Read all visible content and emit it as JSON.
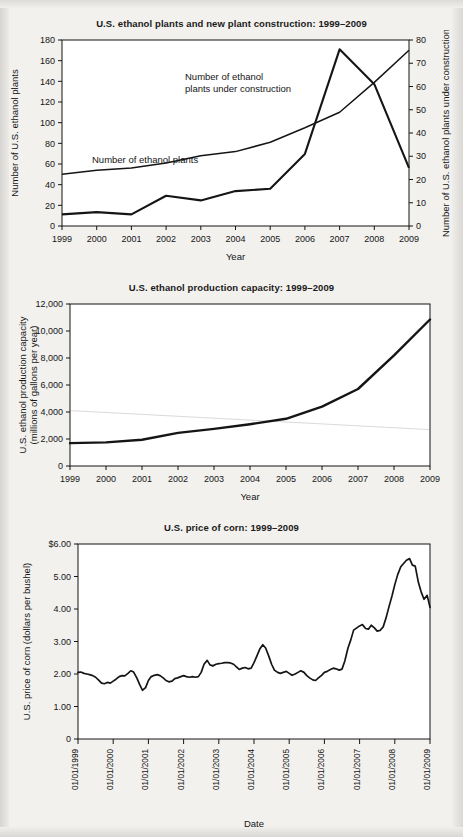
{
  "page": {
    "background_color": "#f2f1ee",
    "ink_color": "#151515"
  },
  "figures": [
    {
      "id": "ethanol-plants",
      "title": "U.S. ethanol plants and new plant construction: 1999–2009",
      "xlabel": "Year",
      "ylabel_left": "Number of U.S. ethanol plants",
      "ylabel_right": "Number of U.S. ethanol plants under construction",
      "annotations": [
        {
          "text_line_1": "Number of ethanol",
          "text_line_2": "plants under construction"
        },
        {
          "text_line_1": "Number of ethanol plants",
          "text_line_2": ""
        }
      ]
    },
    {
      "id": "ethanol-capacity",
      "title": "U.S. ethanol production capacity: 1999–2009",
      "xlabel": "Year",
      "ylabel": "U.S. ethanol production capacity (millions of gallons per year)",
      "ylabel_line_1": "U.S. ethanol production capacity",
      "ylabel_line_2": "(millions of gallons per year)"
    },
    {
      "id": "corn-price",
      "title": "U.S. price of corn: 1999–2009",
      "xlabel": "Date",
      "ylabel": "U.S. price of corn (dollars per bushel)"
    }
  ],
  "chart_data": [
    {
      "type": "line",
      "id": "ethanol-plants",
      "title": "U.S. ethanol plants and new plant construction: 1999–2009",
      "xlabel": "Year",
      "ylabel": "Number of U.S. ethanol plants",
      "y2label": "Number of U.S. ethanol plants under construction",
      "categories": [
        1999,
        2000,
        2001,
        2002,
        2003,
        2004,
        2005,
        2006,
        2007,
        2008,
        2009
      ],
      "xtick_labels": [
        "1999",
        "2000",
        "2001",
        "2002",
        "2003",
        "2004",
        "2005",
        "2006",
        "2007",
        "2008",
        "2009"
      ],
      "ylim": [
        0,
        180
      ],
      "ytick_labels": [
        "0",
        "20",
        "40",
        "60",
        "80",
        "100",
        "120",
        "140",
        "160",
        "180"
      ],
      "yticks": [
        0,
        20,
        40,
        60,
        80,
        100,
        120,
        140,
        160,
        180
      ],
      "y2lim": [
        0,
        80
      ],
      "y2tick_labels": [
        "0",
        "10",
        "20",
        "30",
        "40",
        "50",
        "60",
        "70",
        "80"
      ],
      "y2ticks": [
        0,
        10,
        20,
        30,
        40,
        50,
        60,
        70,
        80
      ],
      "grid": false,
      "legend_position": "inline-annotation",
      "series": [
        {
          "name": "Number of ethanol plants",
          "axis": "left",
          "values": [
            50,
            54,
            56,
            61,
            68,
            72,
            81,
            95,
            110,
            139,
            170
          ]
        },
        {
          "name": "Number of ethanol plants under construction",
          "axis": "right",
          "values": [
            5,
            6,
            5,
            13,
            11,
            15,
            16,
            31,
            76,
            61,
            25
          ]
        }
      ]
    },
    {
      "type": "line",
      "id": "ethanol-capacity",
      "title": "U.S. ethanol production capacity: 1999–2009",
      "xlabel": "Year",
      "ylabel": "U.S. ethanol production capacity (millions of gallons per year)",
      "categories": [
        1999,
        2000,
        2001,
        2002,
        2003,
        2004,
        2005,
        2006,
        2007,
        2008,
        2009
      ],
      "xtick_labels": [
        "1999",
        "2000",
        "2001",
        "2002",
        "2003",
        "2004",
        "2005",
        "2006",
        "2007",
        "2008",
        "2009"
      ],
      "ylim": [
        0,
        12000
      ],
      "yticks": [
        0,
        2000,
        4000,
        6000,
        8000,
        10000,
        12000
      ],
      "ytick_labels": [
        "0",
        "2,000",
        "4,000",
        "6,000",
        "8,000",
        "10,000",
        "12,000"
      ],
      "grid": false,
      "values": [
        1700,
        1750,
        1950,
        2450,
        2750,
        3100,
        3500,
        4400,
        5700,
        8200,
        10850
      ]
    },
    {
      "type": "line",
      "id": "corn-price",
      "title": "U.S. price of corn: 1999–2009",
      "xlabel": "Date",
      "ylabel": "U.S. price of corn (dollars per bushel)",
      "xtick_labels": [
        "01/01/1999",
        "01/01/2000",
        "01/01/2001",
        "01/01/2002",
        "01/01/2003",
        "01/01/2004",
        "01/01/2005",
        "01/01/2006",
        "01/01/2007",
        "01/01/2008",
        "01/01/2009"
      ],
      "ylim": [
        0,
        6
      ],
      "yticks": [
        0,
        1,
        2,
        3,
        4,
        5,
        6
      ],
      "ytick_labels": [
        "0",
        "1.00",
        "2.00",
        "3.00",
        "4.00",
        "5.00",
        "$6.00"
      ],
      "grid": false,
      "x": [
        1999.0,
        1999.08,
        1999.17,
        1999.25,
        1999.33,
        1999.42,
        1999.5,
        1999.58,
        1999.67,
        1999.75,
        1999.83,
        1999.92,
        2000.0,
        2000.08,
        2000.17,
        2000.25,
        2000.33,
        2000.42,
        2000.5,
        2000.58,
        2000.67,
        2000.75,
        2000.83,
        2000.92,
        2001.0,
        2001.08,
        2001.17,
        2001.25,
        2001.33,
        2001.42,
        2001.5,
        2001.58,
        2001.67,
        2001.75,
        2001.83,
        2001.92,
        2002.0,
        2002.08,
        2002.17,
        2002.25,
        2002.33,
        2002.42,
        2002.5,
        2002.58,
        2002.67,
        2002.75,
        2002.83,
        2002.92,
        2003.0,
        2003.08,
        2003.17,
        2003.25,
        2003.33,
        2003.42,
        2003.5,
        2003.58,
        2003.67,
        2003.75,
        2003.83,
        2003.92,
        2004.0,
        2004.08,
        2004.17,
        2004.25,
        2004.33,
        2004.42,
        2004.5,
        2004.58,
        2004.67,
        2004.75,
        2004.83,
        2004.92,
        2005.0,
        2005.08,
        2005.17,
        2005.25,
        2005.33,
        2005.42,
        2005.5,
        2005.58,
        2005.67,
        2005.75,
        2005.83,
        2005.92,
        2006.0,
        2006.08,
        2006.17,
        2006.25,
        2006.33,
        2006.42,
        2006.5,
        2006.58,
        2006.67,
        2006.75,
        2006.83,
        2006.92,
        2007.0,
        2007.08,
        2007.17,
        2007.25,
        2007.33,
        2007.42,
        2007.5,
        2007.58,
        2007.67,
        2007.75,
        2007.83,
        2007.92,
        2008.0,
        2008.08,
        2008.17,
        2008.25,
        2008.33,
        2008.42,
        2008.5,
        2008.58,
        2008.67,
        2008.75,
        2008.83,
        2008.92,
        2009.0
      ],
      "values": [
        2.05,
        2.06,
        2.02,
        2.0,
        1.98,
        1.95,
        1.9,
        1.82,
        1.72,
        1.7,
        1.74,
        1.72,
        1.78,
        1.84,
        1.92,
        1.95,
        1.94,
        2.02,
        2.1,
        2.06,
        1.88,
        1.68,
        1.5,
        1.58,
        1.8,
        1.92,
        1.96,
        1.98,
        1.95,
        1.88,
        1.8,
        1.76,
        1.78,
        1.86,
        1.88,
        1.92,
        1.95,
        1.92,
        1.9,
        1.92,
        1.9,
        1.92,
        2.05,
        2.3,
        2.42,
        2.28,
        2.25,
        2.3,
        2.32,
        2.33,
        2.35,
        2.35,
        2.34,
        2.3,
        2.22,
        2.14,
        2.18,
        2.2,
        2.16,
        2.18,
        2.35,
        2.55,
        2.78,
        2.9,
        2.8,
        2.55,
        2.3,
        2.12,
        2.05,
        2.02,
        2.05,
        2.08,
        2.02,
        1.96,
        2.0,
        2.05,
        2.1,
        2.05,
        1.95,
        1.88,
        1.82,
        1.8,
        1.88,
        1.96,
        2.05,
        2.08,
        2.14,
        2.18,
        2.16,
        2.12,
        2.15,
        2.4,
        2.8,
        3.05,
        3.35,
        3.42,
        3.48,
        3.52,
        3.4,
        3.38,
        3.5,
        3.42,
        3.32,
        3.34,
        3.45,
        3.72,
        4.05,
        4.4,
        4.75,
        5.05,
        5.3,
        5.4,
        5.5,
        5.55,
        5.35,
        5.32,
        4.82,
        4.52,
        4.3,
        4.42,
        4.05,
        3.98,
        3.95,
        4.0,
        4.02
      ]
    }
  ]
}
